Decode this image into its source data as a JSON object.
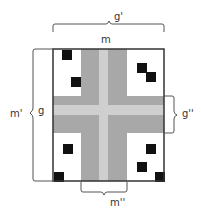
{
  "diagram": {
    "type": "cross-shaped layout with dimension braces",
    "colors": {
      "background": "#ffffff",
      "outline": "#333333",
      "band_dark": "#a8a8a8",
      "band_light": "#cfcfcf",
      "square": "#111111",
      "brace": "#555555"
    },
    "labels": {
      "top_outer": "g'",
      "top_inner": "m",
      "left_outer": "m'",
      "left_inner": "g",
      "right": "g''",
      "bottom": "m''"
    },
    "squares": [
      {
        "x": 62,
        "y": 50,
        "size": 10,
        "region": "top-left"
      },
      {
        "x": 71,
        "y": 77,
        "size": 10,
        "region": "top-left"
      },
      {
        "x": 137,
        "y": 63,
        "size": 10,
        "region": "top-right"
      },
      {
        "x": 146,
        "y": 72,
        "size": 10,
        "region": "top-right"
      },
      {
        "x": 63,
        "y": 144,
        "size": 10,
        "region": "bottom-left"
      },
      {
        "x": 54,
        "y": 172,
        "size": 10,
        "region": "bottom-left"
      },
      {
        "x": 146,
        "y": 144,
        "size": 10,
        "region": "bottom-right"
      },
      {
        "x": 137,
        "y": 162,
        "size": 10,
        "region": "bottom-right"
      },
      {
        "x": 155,
        "y": 172,
        "size": 10,
        "region": "bottom-right"
      }
    ]
  }
}
